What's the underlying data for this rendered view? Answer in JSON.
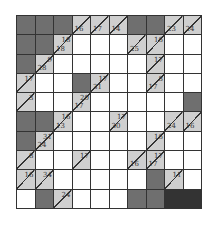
{
  "puzzle": {
    "type": "kakuro",
    "rows": 10,
    "cols": 10,
    "colors": {
      "dark": "#6f6f6f",
      "clue": "#cfcfcf",
      "white": "#ffffff",
      "grid": "#333333",
      "star": "#cfcfcf"
    },
    "grid": [
      [
        {
          "t": "dark"
        },
        {
          "t": "dark"
        },
        {
          "t": "dark"
        },
        {
          "t": "clue",
          "d": "16"
        },
        {
          "t": "clue",
          "d": "17"
        },
        {
          "t": "clue",
          "d": "14"
        },
        {
          "t": "dark"
        },
        {
          "t": "dark"
        },
        {
          "t": "clue",
          "d": "23"
        },
        {
          "t": "clue",
          "d": "24"
        }
      ],
      [
        {
          "t": "dark"
        },
        {
          "t": "dark"
        },
        {
          "t": "clue",
          "d": "18",
          "r": "18"
        },
        {
          "t": "white"
        },
        {
          "t": "white"
        },
        {
          "t": "white"
        },
        {
          "t": "clue",
          "d": "25"
        },
        {
          "t": "clue",
          "r": "16"
        },
        {
          "t": "white"
        },
        {
          "t": "white"
        }
      ],
      [
        {
          "t": "dark"
        },
        {
          "t": "clue",
          "d": "28",
          "r": "9"
        },
        {
          "t": "white"
        },
        {
          "t": "white"
        },
        {
          "t": "white"
        },
        {
          "t": "white"
        },
        {
          "t": "white"
        },
        {
          "t": "clue",
          "r": "17"
        },
        {
          "t": "white"
        },
        {
          "t": "white"
        }
      ],
      [
        {
          "t": "clue",
          "r": "17"
        },
        {
          "t": "white"
        },
        {
          "t": "white"
        },
        {
          "t": "dark"
        },
        {
          "t": "clue",
          "d": "31",
          "r": "17"
        },
        {
          "t": "white"
        },
        {
          "t": "white"
        },
        {
          "t": "clue",
          "d": "17",
          "r": "8"
        },
        {
          "t": "white"
        },
        {
          "t": "white"
        }
      ],
      [
        {
          "t": "clue",
          "r": "3"
        },
        {
          "t": "white"
        },
        {
          "t": "white"
        },
        {
          "t": "clue",
          "d": "17",
          "r": "20"
        },
        {
          "t": "white"
        },
        {
          "t": "white"
        },
        {
          "t": "white"
        },
        {
          "t": "white"
        },
        {
          "t": "white"
        },
        {
          "t": "dark"
        }
      ],
      [
        {
          "t": "dark"
        },
        {
          "t": "dark"
        },
        {
          "t": "clue",
          "d": "13",
          "r": "16"
        },
        {
          "t": "white"
        },
        {
          "t": "white"
        },
        {
          "t": "clue",
          "d": "30",
          "r": "17"
        },
        {
          "t": "white"
        },
        {
          "t": "white"
        },
        {
          "t": "clue",
          "d": "24"
        },
        {
          "t": "clue",
          "d": "16"
        }
      ],
      [
        {
          "t": "dark"
        },
        {
          "t": "clue",
          "d": "24",
          "r": "31"
        },
        {
          "t": "white"
        },
        {
          "t": "white"
        },
        {
          "t": "white"
        },
        {
          "t": "white"
        },
        {
          "t": "white"
        },
        {
          "t": "clue",
          "r": "16"
        },
        {
          "t": "white"
        },
        {
          "t": "white"
        }
      ],
      [
        {
          "t": "clue",
          "r": "8"
        },
        {
          "t": "white"
        },
        {
          "t": "white"
        },
        {
          "t": "clue",
          "r": "17"
        },
        {
          "t": "white"
        },
        {
          "t": "white"
        },
        {
          "t": "clue",
          "d": "16"
        },
        {
          "t": "clue",
          "d": "17",
          "r": "17"
        },
        {
          "t": "white"
        },
        {
          "t": "white"
        }
      ],
      [
        {
          "t": "clue",
          "r": "16"
        },
        {
          "t": "star"
        },
        {
          "t": "star"
        },
        {
          "t": "clue",
          "r": "34"
        },
        {
          "t": "white"
        },
        {
          "t": "white"
        },
        {
          "t": "white"
        },
        {
          "t": "white"
        },
        {
          "t": "white"
        },
        {
          "t": "dark"
        }
      ],
      [
        {
          "t": "clue",
          "r": "11"
        },
        {
          "t": "white"
        },
        {
          "t": "white"
        },
        {
          "t": "dark"
        },
        {
          "t": "clue",
          "r": "24"
        },
        {
          "t": "white"
        },
        {
          "t": "white"
        },
        {
          "t": "white"
        },
        {
          "t": "dark"
        },
        {
          "t": "dark"
        }
      ]
    ],
    "star_glyph": "☆"
  }
}
